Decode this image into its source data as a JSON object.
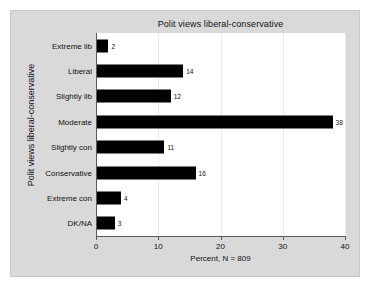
{
  "chart_data": {
    "type": "bar",
    "orientation": "horizontal",
    "title": "Polit views liberal-conservative",
    "xlabel": "Percent, N = 809",
    "ylabel": "Polit views liberal-conservative",
    "categories": [
      "Extreme lib",
      "Liberal",
      "Slightly lib",
      "Moderate",
      "Slightly con",
      "Conservative",
      "Extreme con",
      "DK/NA"
    ],
    "values": [
      2,
      14,
      12,
      38,
      11,
      16,
      4,
      3
    ],
    "data_labels": [
      "2",
      "14",
      "12",
      "38",
      "11",
      "16",
      "4",
      "3"
    ],
    "xlim": [
      0,
      40
    ],
    "xticks": [
      0,
      10,
      20,
      30,
      40
    ],
    "xtick_labels": [
      "0",
      "10",
      "20",
      "30",
      "40"
    ],
    "grid": "vertical-light",
    "legend": null,
    "bar_color": "#000000",
    "plot_background": "#ffffff",
    "graph_background": "#d9d9d9",
    "n": 809
  }
}
